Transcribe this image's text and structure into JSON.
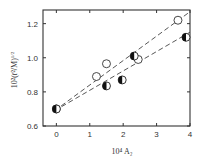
{
  "chart_data": {
    "type": "scatter",
    "title": "",
    "xlabel": "10⁴ A₂",
    "ylabel": "10²(r̄²/M)¹ᐟ²",
    "xlim": [
      -0.4,
      4.0
    ],
    "ylim": [
      0.6,
      1.28
    ],
    "xticks": [
      0,
      1,
      2,
      3,
      4
    ],
    "yticks": [
      0.6,
      0.8,
      1.0,
      1.2
    ],
    "xtick_labels": [
      "0",
      "1",
      "2",
      "3",
      "4"
    ],
    "ytick_labels": [
      "0.6",
      "0.8",
      "1.0",
      "1.2"
    ],
    "grid": false,
    "legend": null,
    "series": [
      {
        "name": "open circles",
        "marker": "open-circle",
        "points": [
          [
            0.0,
            0.7
          ],
          [
            1.2,
            0.89
          ],
          [
            1.5,
            0.965
          ],
          [
            2.45,
            0.99
          ],
          [
            3.64,
            1.22
          ]
        ]
      },
      {
        "name": "half-filled circles",
        "marker": "half-filled-circle",
        "points": [
          [
            0.0,
            0.7
          ],
          [
            1.5,
            0.835
          ],
          [
            1.97,
            0.87
          ],
          [
            2.33,
            1.01
          ],
          [
            3.88,
            1.12
          ]
        ]
      }
    ],
    "lines": [
      {
        "name": "upper dashed fit",
        "style": "dashed",
        "from": [
          -0.05,
          0.69
        ],
        "to": [
          4.0,
          1.27
        ]
      },
      {
        "name": "lower dashed fit",
        "style": "dashed",
        "from": [
          -0.05,
          0.69
        ],
        "to": [
          4.0,
          1.15
        ]
      }
    ]
  },
  "labels": {
    "x_axis": "10⁴ A₂",
    "y_axis_main": "10²(r̄²/M)",
    "y_axis_exp": "1/2"
  }
}
